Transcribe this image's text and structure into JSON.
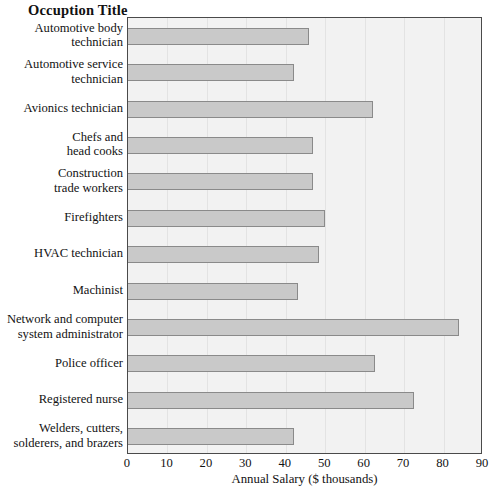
{
  "chart_data": {
    "type": "bar",
    "orientation": "horizontal",
    "title": "Occuption Title",
    "xlabel": "Annual Salary ($ thousands)",
    "ylabel": "Occuption Title",
    "xlim": [
      0,
      90
    ],
    "xticks": [
      0,
      10,
      20,
      30,
      40,
      50,
      60,
      70,
      80,
      90
    ],
    "grid": "vertical",
    "legend": "none",
    "categories": [
      "Automotive body technician",
      "Automotive service technician",
      "Avionics technician",
      "Chefs and head cooks",
      "Construction trade workers",
      "Firefighters",
      "HVAC technician",
      "Machinist",
      "Network and computer system administrator",
      "Police officer",
      "Registered nurse",
      "Welders, cutters, solderers, and brazers"
    ],
    "category_lines": [
      [
        "Automotive body",
        "technician"
      ],
      [
        "Automotive service",
        "technician"
      ],
      [
        "Avionics technician"
      ],
      [
        "Chefs and",
        "head cooks"
      ],
      [
        "Construction",
        "trade workers"
      ],
      [
        "Firefighters"
      ],
      [
        "HVAC technician"
      ],
      [
        "Machinist"
      ],
      [
        "Network and computer",
        "system administrator"
      ],
      [
        "Police officer"
      ],
      [
        "Registered nurse"
      ],
      [
        "Welders, cutters,",
        "solderers, and brazers"
      ]
    ],
    "values": [
      46,
      42,
      62,
      47,
      47,
      50,
      48.5,
      43,
      84,
      62.5,
      72.5,
      42
    ]
  },
  "colors": {
    "bar_fill": "#c9c9c9",
    "bar_border": "#8a8a8a",
    "plot_background": "#f2f2f2",
    "plot_border": "#4a4a4a",
    "gridline": "#e3e3e3",
    "text": "#121212",
    "page_background": "#ffffff"
  }
}
